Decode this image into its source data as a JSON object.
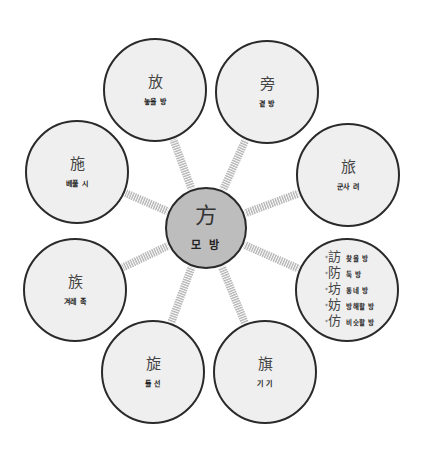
{
  "diagram": {
    "type": "radial-hanja-family",
    "colors": {
      "outer_fill": "#efefef",
      "center_fill": "#bdbdbd",
      "stroke": "#2a2a2a",
      "spoke": "#b5b5b5"
    },
    "center": {
      "hanja": "方",
      "reading": "모 방",
      "cx": 206,
      "cy": 228,
      "r": 41
    },
    "nodes": [
      {
        "id": "bang-release",
        "hanja": "放",
        "reading": "놓을 방",
        "cx": 155,
        "cy": 90,
        "r": 52
      },
      {
        "id": "bang-side",
        "hanja": "旁",
        "reading": "곁 방",
        "cx": 267,
        "cy": 92,
        "r": 52
      },
      {
        "id": "ryeo-troop",
        "hanja": "旅",
        "reading": "군사 려",
        "cx": 348,
        "cy": 175,
        "r": 52
      },
      {
        "id": "si-bestow",
        "hanja": "施",
        "reading": "베풀 시",
        "cx": 77,
        "cy": 172,
        "r": 52
      },
      {
        "id": "jok-clan",
        "hanja": "族",
        "reading": "겨레 족",
        "cx": 75,
        "cy": 290,
        "r": 52
      },
      {
        "id": "seon-revolve",
        "hanja": "旋",
        "reading": "돌 선",
        "cx": 153,
        "cy": 372,
        "r": 52
      },
      {
        "id": "gi-flag",
        "hanja": "旗",
        "reading": "기 기",
        "cx": 265,
        "cy": 372,
        "r": 52
      }
    ],
    "list_node": {
      "cx": 347,
      "cy": 290,
      "r": 52,
      "items": [
        {
          "mark": "*",
          "hanja": "訪",
          "reading": "찾을 방"
        },
        {
          "mark": "*",
          "hanja": "防",
          "reading": "둑 방"
        },
        {
          "mark": "*",
          "hanja": "坊",
          "reading": "동네 방"
        },
        {
          "mark": "*",
          "hanja": "妨",
          "reading": "방해할 방"
        },
        {
          "mark": "*",
          "hanja": "仿",
          "reading": "비슷할 방"
        }
      ]
    }
  }
}
